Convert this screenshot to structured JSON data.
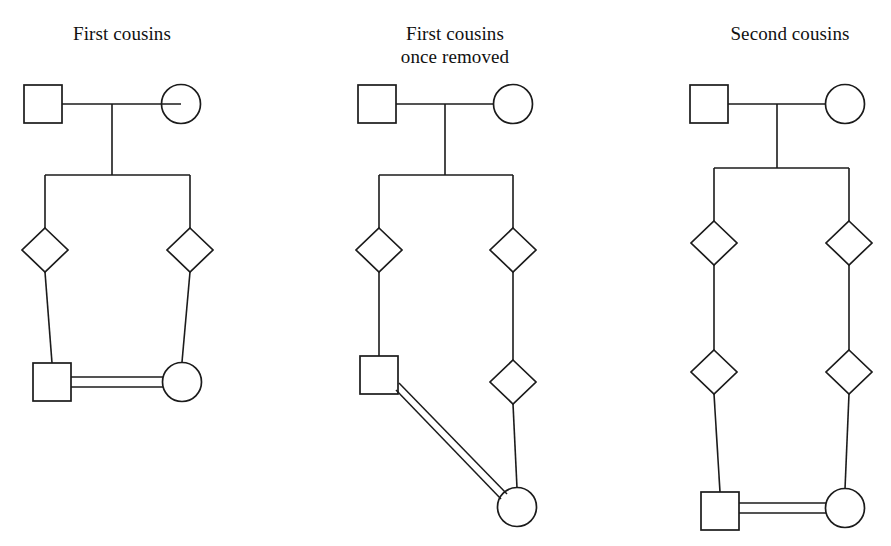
{
  "figure": {
    "kind": "pedigree-chart-set",
    "background_color": "#ffffff",
    "line_color": "#1b1b1b",
    "symbol_fill": "none",
    "panel_count": 3
  },
  "panels": [
    {
      "id": "first-cousins",
      "title": "First cousins",
      "title_lines": [
        "First cousins"
      ],
      "generations": 3,
      "symbols": [
        {
          "name": "grandfather",
          "shape": "square",
          "sex": "male",
          "x": 43,
          "y": 104
        },
        {
          "name": "grandmother",
          "shape": "circle",
          "sex": "female",
          "x": 181,
          "y": 104
        },
        {
          "name": "parent-left",
          "shape": "diamond",
          "sex": "unspecified",
          "x": 45,
          "y": 250
        },
        {
          "name": "parent-right",
          "shape": "diamond",
          "sex": "unspecified",
          "x": 190,
          "y": 250
        },
        {
          "name": "cousin-male",
          "shape": "square",
          "sex": "male",
          "x": 52,
          "y": 382
        },
        {
          "name": "cousin-female",
          "shape": "circle",
          "sex": "female",
          "x": 182,
          "y": 382
        }
      ],
      "relationship": "first cousins",
      "mating_line_style": "double"
    },
    {
      "id": "first-cousins-once-removed",
      "title": "First cousins once removed",
      "title_lines": [
        "First cousins",
        "once removed"
      ],
      "generations": 4,
      "symbols": [
        {
          "name": "grandfather",
          "shape": "square",
          "sex": "male",
          "x": 377,
          "y": 104
        },
        {
          "name": "grandmother",
          "shape": "circle",
          "sex": "female",
          "x": 513,
          "y": 104
        },
        {
          "name": "parent-left",
          "shape": "diamond",
          "sex": "unspecified",
          "x": 379,
          "y": 250
        },
        {
          "name": "parent-right",
          "shape": "diamond",
          "sex": "unspecified",
          "x": 513,
          "y": 250
        },
        {
          "name": "child-right",
          "shape": "diamond",
          "sex": "unspecified",
          "x": 513,
          "y": 382
        },
        {
          "name": "relative-male",
          "shape": "square",
          "sex": "male",
          "x": 379,
          "y": 375
        },
        {
          "name": "relative-female",
          "shape": "circle",
          "sex": "female",
          "x": 517,
          "y": 507
        }
      ],
      "relationship": "first cousins once removed",
      "mating_line_style": "double-diagonal"
    },
    {
      "id": "second-cousins",
      "title": "Second cousins",
      "title_lines": [
        "Second cousins"
      ],
      "generations": 4,
      "symbols": [
        {
          "name": "grandfather",
          "shape": "square",
          "sex": "male",
          "x": 709,
          "y": 104
        },
        {
          "name": "grandmother",
          "shape": "circle",
          "sex": "female",
          "x": 845,
          "y": 104
        },
        {
          "name": "parent-left",
          "shape": "diamond",
          "sex": "unspecified",
          "x": 714,
          "y": 243
        },
        {
          "name": "parent-right",
          "shape": "diamond",
          "sex": "unspecified",
          "x": 849,
          "y": 243
        },
        {
          "name": "child-left",
          "shape": "diamond",
          "sex": "unspecified",
          "x": 714,
          "y": 372
        },
        {
          "name": "child-right",
          "shape": "diamond",
          "sex": "unspecified",
          "x": 849,
          "y": 372
        },
        {
          "name": "cousin-male",
          "shape": "square",
          "sex": "male",
          "x": 720,
          "y": 511
        },
        {
          "name": "cousin-female",
          "shape": "circle",
          "sex": "female",
          "x": 845,
          "y": 508
        }
      ],
      "relationship": "second cousins",
      "mating_line_style": "double"
    }
  ],
  "legend": {
    "square_meaning": "male",
    "circle_meaning": "female",
    "diamond_meaning": "sex unspecified",
    "double_line_meaning": "consanguineous mating"
  }
}
